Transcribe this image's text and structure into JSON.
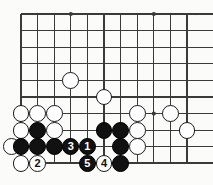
{
  "figure": {
    "kind": "go-board-diagram",
    "board": {
      "origin_x": 21,
      "origin_y": 14,
      "spacing": 16.6,
      "cols": 11,
      "rows": 10,
      "line_color": "#3a3a3a",
      "background_color": "#fbfbf9",
      "stone_radius": 8.4
    },
    "star_points": [
      {
        "col": 3,
        "row": 0
      },
      {
        "col": 8,
        "row": 0
      },
      {
        "col": 8,
        "row": 6
      }
    ],
    "colors": {
      "black_stone": "#111111",
      "white_stone": "#ffffff",
      "stone_outline": "#1a1a1a",
      "black_label": "#ffffff",
      "white_label": "#111111"
    },
    "stones": [
      {
        "id": "w-c3-r4",
        "color": "white",
        "col": 3,
        "row": 4,
        "label": ""
      },
      {
        "id": "w-c5-r5",
        "color": "white",
        "col": 5,
        "row": 5,
        "label": ""
      },
      {
        "id": "w-c0-r6",
        "color": "white",
        "col": 0,
        "row": 6,
        "label": ""
      },
      {
        "id": "w-c1-r6",
        "color": "white",
        "col": 1,
        "row": 6,
        "label": ""
      },
      {
        "id": "w-c2-r6",
        "color": "white",
        "col": 2,
        "row": 6,
        "label": ""
      },
      {
        "id": "w-c7-r6",
        "color": "white",
        "col": 7,
        "row": 6,
        "label": ""
      },
      {
        "id": "w-c9-r6",
        "color": "white",
        "col": 9,
        "row": 6,
        "label": ""
      },
      {
        "id": "w-c0-r7",
        "color": "white",
        "col": 0,
        "row": 7,
        "label": ""
      },
      {
        "id": "b-c1-r7",
        "color": "black",
        "col": 1,
        "row": 7,
        "label": ""
      },
      {
        "id": "w-c2-r7",
        "color": "white",
        "col": 2,
        "row": 7,
        "label": ""
      },
      {
        "id": "b-c5-r7",
        "color": "black",
        "col": 5,
        "row": 7,
        "label": ""
      },
      {
        "id": "b-c6-r7",
        "color": "black",
        "col": 6,
        "row": 7,
        "label": ""
      },
      {
        "id": "w-c7-r7",
        "color": "white",
        "col": 7,
        "row": 7,
        "label": ""
      },
      {
        "id": "w-c10-r7",
        "color": "white",
        "col": 10,
        "row": 7,
        "label": ""
      },
      {
        "id": "w-cm1-r8",
        "color": "white",
        "col": -0.55,
        "row": 8,
        "label": ""
      },
      {
        "id": "b-c0-r8",
        "color": "black",
        "col": 0,
        "row": 8,
        "label": ""
      },
      {
        "id": "b-c1-r8",
        "color": "black",
        "col": 1,
        "row": 8,
        "label": ""
      },
      {
        "id": "b-c2-r8",
        "color": "black",
        "col": 2,
        "row": 8,
        "label": ""
      },
      {
        "id": "b-c3-r8",
        "color": "black",
        "col": 3,
        "row": 8,
        "label": "3"
      },
      {
        "id": "b-c4-r8",
        "color": "black",
        "col": 4,
        "row": 8,
        "label": "1"
      },
      {
        "id": "b-c6-r8",
        "color": "black",
        "col": 6,
        "row": 8,
        "label": ""
      },
      {
        "id": "w-c7-r8",
        "color": "white",
        "col": 7,
        "row": 8,
        "label": ""
      },
      {
        "id": "w-c0-r9",
        "color": "white",
        "col": 0,
        "row": 9,
        "label": ""
      },
      {
        "id": "w-c1-r9",
        "color": "white",
        "col": 1,
        "row": 9,
        "label": "2"
      },
      {
        "id": "b-c4-r9",
        "color": "black",
        "col": 4,
        "row": 9,
        "label": "5"
      },
      {
        "id": "w-c5-r9",
        "color": "white",
        "col": 5,
        "row": 9,
        "label": "4"
      },
      {
        "id": "b-c6-r9",
        "color": "black",
        "col": 6,
        "row": 9,
        "label": ""
      }
    ],
    "move_sequence": [
      {
        "number": "1",
        "color": "black"
      },
      {
        "number": "2",
        "color": "white"
      },
      {
        "number": "3",
        "color": "black"
      },
      {
        "number": "4",
        "color": "white"
      },
      {
        "number": "5",
        "color": "black"
      }
    ]
  }
}
